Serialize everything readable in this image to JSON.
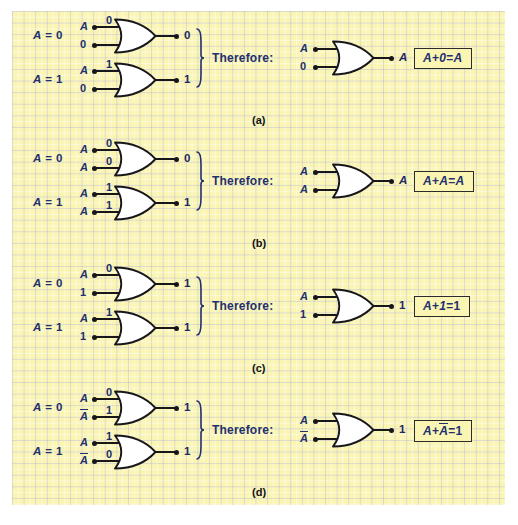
{
  "figure": {
    "colors": {
      "paper": "#fbf5b4",
      "grid": "#9696aa",
      "ink": "#22306e",
      "wire": "#17161a",
      "box_border": "#2b2b2b",
      "gate_fill": "#ffffff"
    },
    "therefore_label": "Therefore:"
  },
  "panels": [
    {
      "letter": "(a)",
      "rule": "A + 0 = A",
      "equation_parts": {
        "left": "A",
        "op": "+",
        "right": "0",
        "eq": "=",
        "result": "A"
      },
      "equation_right_overbar": false,
      "cases": [
        {
          "condition": "A = 0",
          "condition_var": "A",
          "condition_value": "0",
          "inputs": [
            {
              "label": "A",
              "italic": true,
              "overbar": false,
              "bit": "0"
            },
            {
              "label": "0",
              "italic": false,
              "overbar": false,
              "bit": ""
            }
          ],
          "output": "0",
          "output_italic": false
        },
        {
          "condition": "A = 1",
          "condition_var": "A",
          "condition_value": "1",
          "inputs": [
            {
              "label": "A",
              "italic": true,
              "overbar": false,
              "bit": "1"
            },
            {
              "label": "0",
              "italic": false,
              "overbar": false,
              "bit": ""
            }
          ],
          "output": "1",
          "output_italic": false
        }
      ],
      "summary": {
        "inputs": [
          {
            "label": "A",
            "italic": true,
            "overbar": false
          },
          {
            "label": "0",
            "italic": false,
            "overbar": false
          }
        ],
        "output": "A",
        "output_italic": true
      }
    },
    {
      "letter": "(b)",
      "rule": "A + A = A",
      "equation_parts": {
        "left": "A",
        "op": "+",
        "right": "A",
        "eq": "=",
        "result": "A"
      },
      "equation_right_overbar": false,
      "cases": [
        {
          "condition": "A = 0",
          "condition_var": "A",
          "condition_value": "0",
          "inputs": [
            {
              "label": "A",
              "italic": true,
              "overbar": false,
              "bit": "0"
            },
            {
              "label": "A",
              "italic": true,
              "overbar": false,
              "bit": "0"
            }
          ],
          "output": "0",
          "output_italic": false
        },
        {
          "condition": "A = 1",
          "condition_var": "A",
          "condition_value": "1",
          "inputs": [
            {
              "label": "A",
              "italic": true,
              "overbar": false,
              "bit": "1"
            },
            {
              "label": "A",
              "italic": true,
              "overbar": false,
              "bit": "1"
            }
          ],
          "output": "1",
          "output_italic": false
        }
      ],
      "summary": {
        "inputs": [
          {
            "label": "A",
            "italic": true,
            "overbar": false
          },
          {
            "label": "A",
            "italic": true,
            "overbar": false
          }
        ],
        "output": "A",
        "output_italic": true
      }
    },
    {
      "letter": "(c)",
      "rule": "A + 1 = 1",
      "equation_parts": {
        "left": "A",
        "op": "+",
        "right": "1",
        "eq": "=",
        "result": "1"
      },
      "equation_right_overbar": false,
      "cases": [
        {
          "condition": "A = 0",
          "condition_var": "A",
          "condition_value": "0",
          "inputs": [
            {
              "label": "A",
              "italic": true,
              "overbar": false,
              "bit": "0"
            },
            {
              "label": "1",
              "italic": false,
              "overbar": false,
              "bit": ""
            }
          ],
          "output": "1",
          "output_italic": false
        },
        {
          "condition": "A = 1",
          "condition_var": "A",
          "condition_value": "1",
          "inputs": [
            {
              "label": "A",
              "italic": true,
              "overbar": false,
              "bit": "1"
            },
            {
              "label": "1",
              "italic": false,
              "overbar": false,
              "bit": ""
            }
          ],
          "output": "1",
          "output_italic": false
        }
      ],
      "summary": {
        "inputs": [
          {
            "label": "A",
            "italic": true,
            "overbar": false
          },
          {
            "label": "1",
            "italic": false,
            "overbar": false
          }
        ],
        "output": "1",
        "output_italic": false
      }
    },
    {
      "letter": "(d)",
      "rule": "A + Ā = 1",
      "equation_parts": {
        "left": "A",
        "op": "+",
        "right": "A",
        "eq": "=",
        "result": "1"
      },
      "equation_right_overbar": true,
      "cases": [
        {
          "condition": "A = 0",
          "condition_var": "A",
          "condition_value": "0",
          "inputs": [
            {
              "label": "A",
              "italic": true,
              "overbar": false,
              "bit": "0"
            },
            {
              "label": "A",
              "italic": true,
              "overbar": true,
              "bit": "1"
            }
          ],
          "output": "1",
          "output_italic": false
        },
        {
          "condition": "A = 1",
          "condition_var": "A",
          "condition_value": "1",
          "inputs": [
            {
              "label": "A",
              "italic": true,
              "overbar": false,
              "bit": "1"
            },
            {
              "label": "A",
              "italic": true,
              "overbar": true,
              "bit": "0"
            }
          ],
          "output": "1",
          "output_italic": false
        }
      ],
      "summary": {
        "inputs": [
          {
            "label": "A",
            "italic": true,
            "overbar": false
          },
          {
            "label": "A",
            "italic": true,
            "overbar": true
          }
        ],
        "output": "1",
        "output_italic": false
      }
    }
  ]
}
